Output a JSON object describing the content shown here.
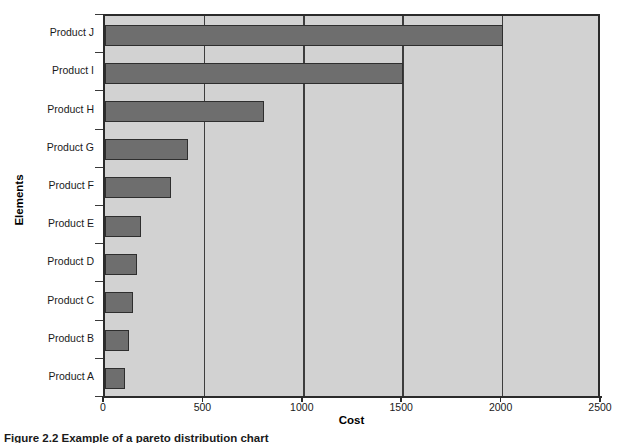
{
  "chart_data": {
    "type": "bar",
    "orientation": "horizontal",
    "title": "",
    "xlabel": "Cost",
    "ylabel": "Elements",
    "categories": [
      "Product A",
      "Product B",
      "Product C",
      "Product D",
      "Product E",
      "Product F",
      "Product G",
      "Product H",
      "Product I",
      "Product J"
    ],
    "values": [
      100,
      120,
      140,
      160,
      180,
      330,
      420,
      800,
      1500,
      2000
    ],
    "xlim": [
      0,
      2500
    ],
    "xticks": [
      0,
      500,
      1000,
      1500,
      2000,
      2500
    ],
    "xtick_labels": [
      "0",
      "500",
      "1000",
      "1500",
      "2000",
      "2500"
    ],
    "grid": true,
    "grid_axis": "x",
    "legend": false,
    "bar_color": "#6e6e6e",
    "bar_edge_color": "#2e2e2e",
    "plot_background": "#d2d2d2",
    "figure_background": "#ffffff"
  },
  "axes": {
    "x_title": "Cost",
    "y_title": "Elements"
  },
  "caption": {
    "text": "Figure 2.2 Example of a pareto distribution chart"
  }
}
